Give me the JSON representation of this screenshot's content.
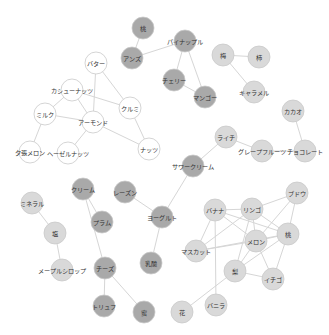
{
  "diagram": {
    "type": "network-graph",
    "colors": {
      "white": "#ffffff",
      "light": "#d9d9d9",
      "dark": "#a9a9a9",
      "edge": "#d6d6d6",
      "stroke": "#c9c9c9"
    },
    "node_radius": 11,
    "nodes": [
      {
        "id": "momo_top",
        "label": "桃",
        "x": 143,
        "y": 28,
        "group": "dark"
      },
      {
        "id": "anzu",
        "label": "アンズ",
        "x": 132,
        "y": 58,
        "group": "dark"
      },
      {
        "id": "pineapple",
        "label": "パイナップル",
        "x": 185,
        "y": 41,
        "group": "dark"
      },
      {
        "id": "cherry",
        "label": "チェリー",
        "x": 174,
        "y": 80,
        "group": "dark"
      },
      {
        "id": "mango",
        "label": "マンゴー",
        "x": 205,
        "y": 97,
        "group": "dark"
      },
      {
        "id": "ume",
        "label": "梅",
        "x": 223,
        "y": 55,
        "group": "light"
      },
      {
        "id": "kaki",
        "label": "柿",
        "x": 259,
        "y": 57,
        "group": "light"
      },
      {
        "id": "caramel",
        "label": "キャラメル",
        "x": 254,
        "y": 92,
        "group": "light"
      },
      {
        "id": "cacao",
        "label": "カカオ",
        "x": 293,
        "y": 111,
        "group": "light"
      },
      {
        "id": "lychee",
        "label": "ライチ",
        "x": 226,
        "y": 137,
        "group": "light"
      },
      {
        "id": "grapefruit",
        "label": "グレープフルーツ",
        "x": 262,
        "y": 151,
        "group": "light"
      },
      {
        "id": "chocolate",
        "label": "チョコレート",
        "x": 305,
        "y": 151,
        "group": "light"
      },
      {
        "id": "butter",
        "label": "バター",
        "x": 96,
        "y": 63,
        "group": "white"
      },
      {
        "id": "cashew",
        "label": "カシューナッツ",
        "x": 72,
        "y": 90,
        "group": "white"
      },
      {
        "id": "kurumi",
        "label": "クルミ",
        "x": 130,
        "y": 108,
        "group": "white"
      },
      {
        "id": "milk",
        "label": "ミルク",
        "x": 45,
        "y": 114,
        "group": "white"
      },
      {
        "id": "almond",
        "label": "アーモンド",
        "x": 93,
        "y": 122,
        "group": "white"
      },
      {
        "id": "nuts",
        "label": "ナッツ",
        "x": 149,
        "y": 149,
        "group": "white"
      },
      {
        "id": "yubari",
        "label": "夕張メロン",
        "x": 30,
        "y": 152,
        "group": "white"
      },
      {
        "id": "hazelnut",
        "label": "ヘーゼルナッツ",
        "x": 68,
        "y": 153,
        "group": "white"
      },
      {
        "id": "sourcream",
        "label": "サワークリーム",
        "x": 193,
        "y": 166,
        "group": "dark"
      },
      {
        "id": "cream",
        "label": "クリーム",
        "x": 83,
        "y": 189,
        "group": "dark"
      },
      {
        "id": "raisin",
        "label": "レーズン",
        "x": 125,
        "y": 192,
        "group": "dark"
      },
      {
        "id": "yogurt",
        "label": "ヨーグルト",
        "x": 162,
        "y": 217,
        "group": "dark"
      },
      {
        "id": "plum",
        "label": "プラム",
        "x": 102,
        "y": 222,
        "group": "dark"
      },
      {
        "id": "mineral",
        "label": "ミネラル",
        "x": 32,
        "y": 203,
        "group": "light"
      },
      {
        "id": "shio",
        "label": "塩",
        "x": 55,
        "y": 233,
        "group": "light"
      },
      {
        "id": "nyusan",
        "label": "乳酸",
        "x": 151,
        "y": 263,
        "group": "dark"
      },
      {
        "id": "cheese",
        "label": "チーズ",
        "x": 105,
        "y": 268,
        "group": "dark"
      },
      {
        "id": "maple",
        "label": "メープルシロップ",
        "x": 62,
        "y": 270,
        "group": "light"
      },
      {
        "id": "truffle",
        "label": "トリュフ",
        "x": 104,
        "y": 306,
        "group": "dark"
      },
      {
        "id": "mitsu",
        "label": "蜜",
        "x": 144,
        "y": 312,
        "group": "dark"
      },
      {
        "id": "hana",
        "label": "花",
        "x": 182,
        "y": 312,
        "group": "light"
      },
      {
        "id": "vanilla",
        "label": "バニラ",
        "x": 216,
        "y": 305,
        "group": "light"
      },
      {
        "id": "banana",
        "label": "バナナ",
        "x": 215,
        "y": 210,
        "group": "light"
      },
      {
        "id": "ringo",
        "label": "リンゴ",
        "x": 252,
        "y": 209,
        "group": "light"
      },
      {
        "id": "budou",
        "label": "ブドウ",
        "x": 297,
        "y": 193,
        "group": "light"
      },
      {
        "id": "momo",
        "label": "桃",
        "x": 288,
        "y": 234,
        "group": "light"
      },
      {
        "id": "melon",
        "label": "メロン",
        "x": 256,
        "y": 241,
        "group": "light"
      },
      {
        "id": "muscat",
        "label": "マスカット",
        "x": 196,
        "y": 251,
        "group": "light"
      },
      {
        "id": "nashi",
        "label": "梨",
        "x": 235,
        "y": 271,
        "group": "light"
      },
      {
        "id": "ichigo",
        "label": "イチゴ",
        "x": 273,
        "y": 279,
        "group": "light"
      }
    ],
    "edges": [
      [
        "momo_top",
        "anzu"
      ],
      [
        "anzu",
        "pineapple"
      ],
      [
        "pineapple",
        "cherry"
      ],
      [
        "pineapple",
        "mango"
      ],
      [
        "cherry",
        "mango"
      ],
      [
        "ume",
        "kaki"
      ],
      [
        "ume",
        "caramel"
      ],
      [
        "cacao",
        "chocolate"
      ],
      [
        "lychee",
        "grapefruit"
      ],
      [
        "grapefruit",
        "chocolate"
      ],
      [
        "lychee",
        "sourcream"
      ],
      [
        "butter",
        "almond"
      ],
      [
        "butter",
        "kurumi"
      ],
      [
        "cashew",
        "kurumi"
      ],
      [
        "cashew",
        "almond"
      ],
      [
        "cashew",
        "milk"
      ],
      [
        "milk",
        "almond"
      ],
      [
        "milk",
        "yubari"
      ],
      [
        "almond",
        "hazelnut"
      ],
      [
        "almond",
        "nuts"
      ],
      [
        "kurumi",
        "nuts"
      ],
      [
        "sourcream",
        "yogurt"
      ],
      [
        "raisin",
        "yogurt"
      ],
      [
        "yogurt",
        "nyusan"
      ],
      [
        "cream",
        "plum"
      ],
      [
        "cream",
        "cheese"
      ],
      [
        "cheese",
        "truffle"
      ],
      [
        "cheese",
        "mitsu"
      ],
      [
        "mineral",
        "shio"
      ],
      [
        "shio",
        "maple"
      ],
      [
        "hana",
        "nashi"
      ],
      [
        "banana",
        "vanilla"
      ],
      [
        "banana",
        "ringo"
      ],
      [
        "banana",
        "momo"
      ],
      [
        "banana",
        "melon"
      ],
      [
        "banana",
        "muscat"
      ],
      [
        "ringo",
        "budou"
      ],
      [
        "ringo",
        "momo"
      ],
      [
        "ringo",
        "melon"
      ],
      [
        "ringo",
        "nashi"
      ],
      [
        "ringo",
        "muscat"
      ],
      [
        "budou",
        "momo"
      ],
      [
        "budou",
        "melon"
      ],
      [
        "momo",
        "melon"
      ],
      [
        "momo",
        "nashi"
      ],
      [
        "momo",
        "ichigo"
      ],
      [
        "momo",
        "muscat"
      ],
      [
        "melon",
        "nashi"
      ],
      [
        "melon",
        "ichigo"
      ],
      [
        "melon",
        "muscat"
      ],
      [
        "nashi",
        "ichigo"
      ]
    ]
  }
}
